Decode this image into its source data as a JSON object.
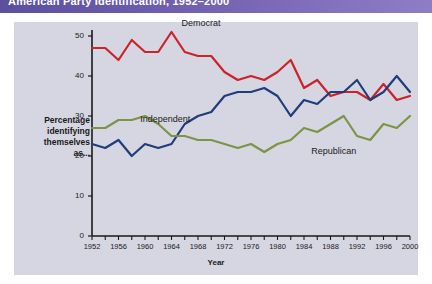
{
  "title": {
    "text": "American Party Identification, 1952–2000",
    "bar_color": "#6f5fae"
  },
  "axes": {
    "y_label": "Percentage identifying themselves as...",
    "y_label_lines": [
      "Percentage",
      "identifying",
      "themselves",
      "as..."
    ],
    "x_label": "Year",
    "y_ticks": [
      0,
      10,
      20,
      30,
      40,
      50
    ],
    "x_ticks": [
      1952,
      1956,
      1960,
      1964,
      1968,
      1972,
      1976,
      1980,
      1984,
      1988,
      1992,
      1996,
      2000
    ]
  },
  "series_labels": {
    "democrat": "Democrat",
    "independent": "Independent",
    "republican": "Republican"
  },
  "colors": {
    "democrat": "#cc2229",
    "independent": "#1f3d7a",
    "republican": "#7d9444",
    "plot_background": "#d6d5e2",
    "axis": "#1a1a1a"
  },
  "chart_data": {
    "type": "line",
    "title": "American Party Identification, 1952–2000",
    "xlabel": "Year",
    "ylabel": "Percentage identifying themselves as...",
    "xlim": [
      1952,
      2000
    ],
    "ylim": [
      0,
      50
    ],
    "grid": false,
    "legend": "inline-annotations",
    "x": [
      1952,
      1954,
      1956,
      1958,
      1960,
      1962,
      1964,
      1966,
      1968,
      1970,
      1972,
      1974,
      1976,
      1978,
      1980,
      1982,
      1984,
      1986,
      1988,
      1990,
      1992,
      1994,
      1996,
      1998,
      2000
    ],
    "series": [
      {
        "name": "Democrat",
        "color": "#cc2229",
        "values": [
          47,
          47,
          44,
          49,
          46,
          46,
          51,
          46,
          45,
          45,
          41,
          39,
          40,
          39,
          41,
          44,
          37,
          39,
          35,
          36,
          36,
          34,
          38,
          34,
          35
        ]
      },
      {
        "name": "Independent",
        "color": "#1f3d7a",
        "values": [
          23,
          22,
          24,
          20,
          23,
          22,
          23,
          28,
          30,
          31,
          35,
          36,
          36,
          37,
          35,
          30,
          34,
          33,
          36,
          36,
          39,
          34,
          36,
          40,
          36
        ]
      },
      {
        "name": "Republican",
        "color": "#7d9444",
        "values": [
          27,
          27,
          29,
          29,
          30,
          28,
          25,
          25,
          24,
          24,
          23,
          22,
          23,
          21,
          23,
          24,
          27,
          26,
          28,
          30,
          25,
          24,
          28,
          27,
          30
        ]
      }
    ]
  }
}
